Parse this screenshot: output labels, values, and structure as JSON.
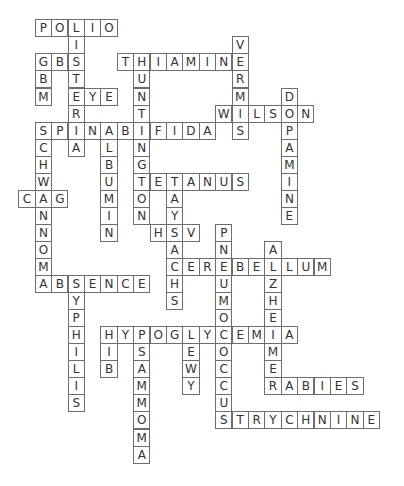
{
  "puzzle": {
    "type": "crossword-solution",
    "grid": {
      "origin_x": 34.7,
      "origin_y": 19.3,
      "col_pitch": 16.4,
      "row_pitch": 17.05,
      "border_color": "#6e6e6e",
      "text_color": "#333333",
      "background": "#ffffff"
    },
    "words": [
      {
        "word": "POLIO",
        "dir": "across",
        "row": 0,
        "col": 0
      },
      {
        "word": "LISTERIA",
        "dir": "down",
        "row": 0,
        "col": 2
      },
      {
        "word": "GBS",
        "dir": "across",
        "row": 2,
        "col": 0
      },
      {
        "word": "GBM",
        "dir": "down",
        "row": 2,
        "col": 0
      },
      {
        "word": "EYE",
        "dir": "across",
        "row": 4,
        "col": 2
      },
      {
        "word": "THIAMINE",
        "dir": "across",
        "row": 2,
        "col": 5
      },
      {
        "word": "VERMIS",
        "dir": "down",
        "row": 1,
        "col": 12
      },
      {
        "word": "HUNTINGTON",
        "dir": "down",
        "row": 2,
        "col": 6
      },
      {
        "word": "WILSON",
        "dir": "across",
        "row": 5,
        "col": 11
      },
      {
        "word": "DOPAMINE",
        "dir": "down",
        "row": 4,
        "col": 15
      },
      {
        "word": "SPINABIFIDA",
        "dir": "across",
        "row": 6,
        "col": 0
      },
      {
        "word": "SCHWANNOMA",
        "dir": "down",
        "row": 6,
        "col": 0
      },
      {
        "word": "ALBUMIN",
        "dir": "down",
        "row": 6,
        "col": 4
      },
      {
        "word": "CAG",
        "dir": "across",
        "row": 10,
        "col": -1
      },
      {
        "word": "TETANUS",
        "dir": "across",
        "row": 9,
        "col": 6
      },
      {
        "word": "TAYSACHS",
        "dir": "down",
        "row": 9,
        "col": 8
      },
      {
        "word": "HSV",
        "dir": "across",
        "row": 12,
        "col": 7
      },
      {
        "word": "PNEUMOCOCCUS",
        "dir": "down",
        "row": 12,
        "col": 11
      },
      {
        "word": "ALZHEIMER",
        "dir": "down",
        "row": 13,
        "col": 14
      },
      {
        "word": "CEREBELLUM",
        "dir": "across",
        "row": 14,
        "col": 8
      },
      {
        "word": "ABSENCE",
        "dir": "across",
        "row": 15,
        "col": 0
      },
      {
        "word": "SYPHILIS",
        "dir": "down",
        "row": 15,
        "col": 2
      },
      {
        "word": "HYPOGLYCEMIA",
        "dir": "across",
        "row": 18,
        "col": 4
      },
      {
        "word": "HIB",
        "dir": "down",
        "row": 18,
        "col": 4
      },
      {
        "word": "PSAMMOMA",
        "dir": "down",
        "row": 18,
        "col": 6
      },
      {
        "word": "LEWY",
        "dir": "down",
        "row": 18,
        "col": 9
      },
      {
        "word": "RABIES",
        "dir": "across",
        "row": 21,
        "col": 14
      },
      {
        "word": "STRYCHNINE",
        "dir": "across",
        "row": 23,
        "col": 11
      }
    ]
  }
}
